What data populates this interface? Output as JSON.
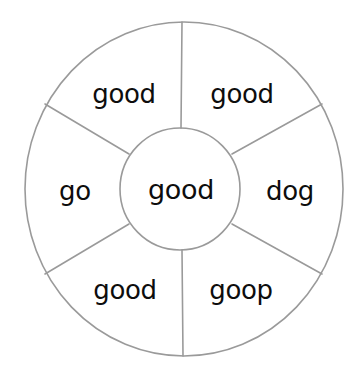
{
  "diagram": {
    "type": "word-wheel",
    "background_color": "#ffffff",
    "line_color": "#9a9a9a",
    "text_color": "#0d0d0d",
    "geometry": {
      "center_x": 184,
      "center_y": 189,
      "outer_radius": 160,
      "inner_radius": 61,
      "segment_count": 6
    },
    "center": {
      "word": "good"
    },
    "segments": [
      {
        "position": "top-left",
        "word": "good",
        "label_x": 124,
        "label_y": 95
      },
      {
        "position": "top-right",
        "word": "good",
        "label_x": 242,
        "label_y": 95
      },
      {
        "position": "right",
        "word": "dog",
        "label_x": 290,
        "label_y": 192
      },
      {
        "position": "bottom-right",
        "word": "goop",
        "label_x": 241,
        "label_y": 291
      },
      {
        "position": "bottom-left",
        "word": "good",
        "label_x": 125,
        "label_y": 291
      },
      {
        "position": "left",
        "word": "go",
        "label_x": 75,
        "label_y": 192
      }
    ]
  }
}
